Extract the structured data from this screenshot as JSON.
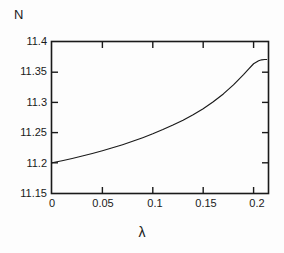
{
  "figure": {
    "background_color": "#fdfdfd",
    "line_color": "#1a1a1a",
    "axis_color": "#1a1a1a"
  },
  "chart_data": {
    "type": "line",
    "title": "",
    "xlabel": "λ",
    "ylabel": "N",
    "xlim": [
      0,
      0.2143
    ],
    "ylim": [
      11.15,
      11.4
    ],
    "grid": false,
    "legend": null,
    "xticks": [
      "0",
      "0.05",
      "0.1",
      "0.15",
      "0.2"
    ],
    "xtick_values": [
      0,
      0.05,
      0.1,
      0.15,
      0.2
    ],
    "yticks": [
      "11.15",
      "11.2",
      "11.25",
      "11.3",
      "11.35",
      "11.4"
    ],
    "ytick_values": [
      11.15,
      11.2,
      11.25,
      11.3,
      11.35,
      11.4
    ],
    "series": [
      {
        "name": "N(λ)",
        "x": [
          0.0,
          0.01,
          0.02,
          0.03,
          0.04,
          0.05,
          0.06,
          0.07,
          0.08,
          0.09,
          0.1,
          0.11,
          0.12,
          0.13,
          0.14,
          0.15,
          0.16,
          0.17,
          0.18,
          0.19,
          0.195,
          0.2,
          0.205,
          0.208,
          0.211,
          0.213
        ],
        "y": [
          11.2,
          11.2035,
          11.2072,
          11.2112,
          11.2155,
          11.22,
          11.2248,
          11.23,
          11.2356,
          11.2416,
          11.248,
          11.255,
          11.2625,
          11.2706,
          11.2796,
          11.2896,
          11.301,
          11.314,
          11.329,
          11.346,
          11.355,
          11.364,
          11.369,
          11.3705,
          11.371,
          11.371
        ]
      }
    ]
  }
}
